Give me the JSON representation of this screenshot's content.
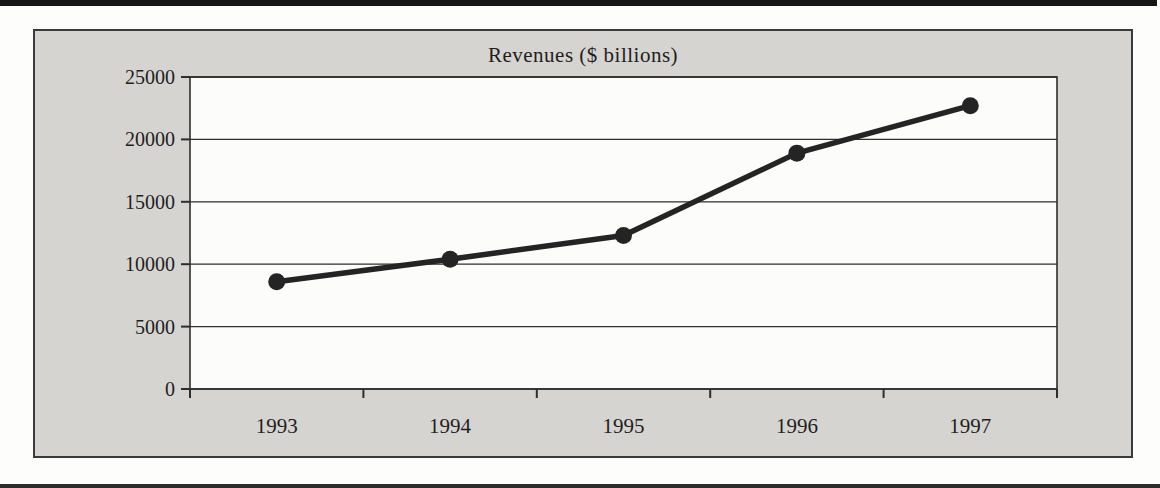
{
  "colors": {
    "page_background": "#fdfdfc",
    "frame_background": "#d6d4d0",
    "plot_background": "#fcfcfa",
    "ink": "#2e2e2e",
    "line_color": "#242424",
    "rule_color": "#151515"
  },
  "chart_data": {
    "type": "line",
    "title": "Revenues ($ billions)",
    "categories": [
      "1993",
      "1994",
      "1995",
      "1996",
      "1997"
    ],
    "values": [
      8600,
      10400,
      12300,
      18900,
      22700
    ],
    "xlabel": "",
    "ylabel": "",
    "ylim": [
      0,
      25000
    ],
    "yticks": [
      0,
      5000,
      10000,
      15000,
      20000,
      25000
    ],
    "grid": true,
    "legend": "none",
    "marker": "circle",
    "marker_color": "#242424"
  }
}
